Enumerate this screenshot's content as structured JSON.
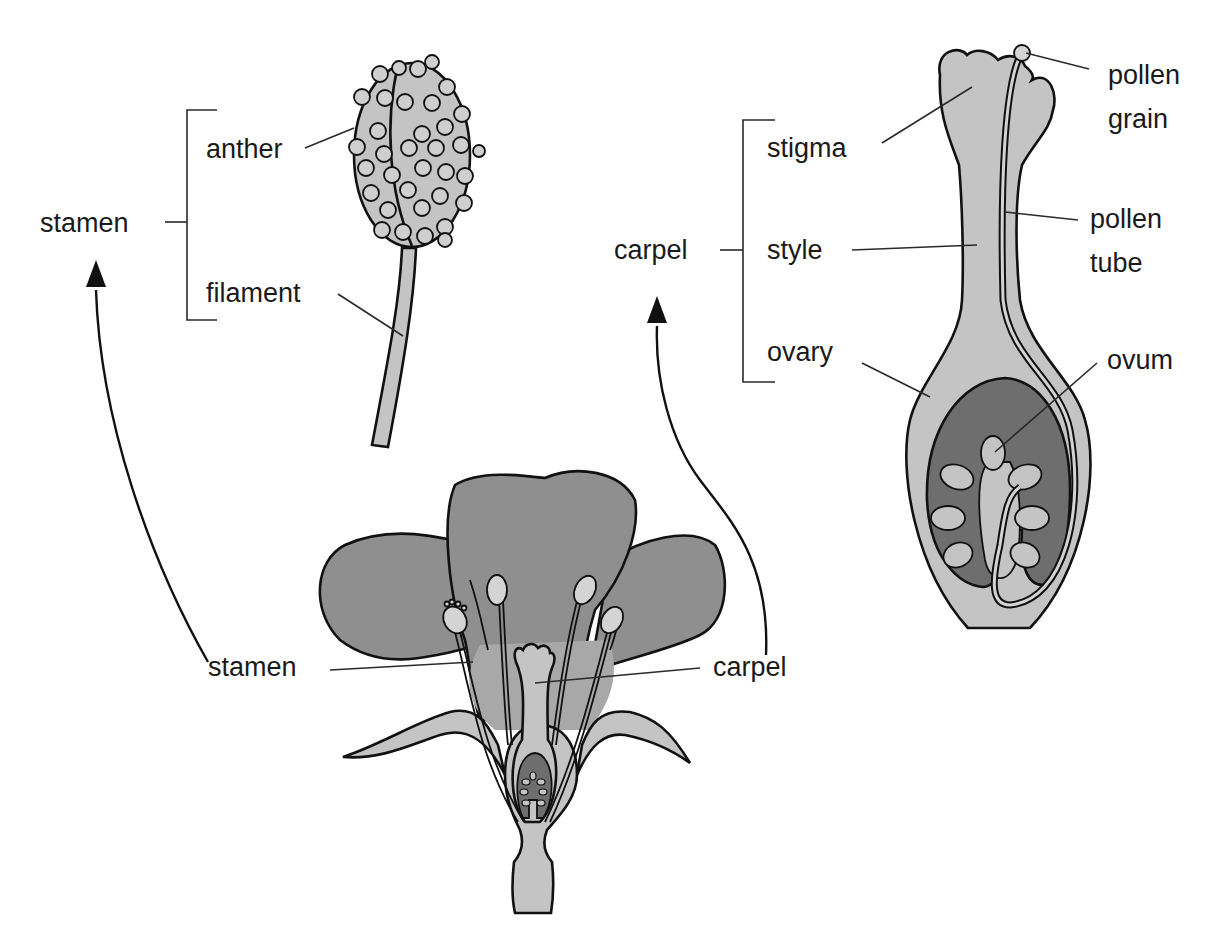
{
  "diagram": {
    "colors": {
      "petal": "#8f8f8f",
      "light_tissue": "#c4c4c4",
      "ovary_cavity": "#6e6e6e",
      "outline": "#111111",
      "background": "#ffffff"
    },
    "stamen_detail": {
      "group_label": "stamen",
      "parts": [
        {
          "label": "anther"
        },
        {
          "label": "filament"
        }
      ]
    },
    "carpel_detail": {
      "group_label": "carpel",
      "parts": [
        {
          "label": "stigma"
        },
        {
          "label": "style"
        },
        {
          "label": "ovary"
        }
      ],
      "annotations": [
        {
          "line1": "pollen",
          "line2": "grain"
        },
        {
          "line1": "pollen",
          "line2": "tube"
        },
        {
          "line1": "ovum"
        }
      ]
    },
    "whole_flower": {
      "labels": [
        {
          "label": "stamen"
        },
        {
          "label": "carpel"
        }
      ]
    }
  }
}
